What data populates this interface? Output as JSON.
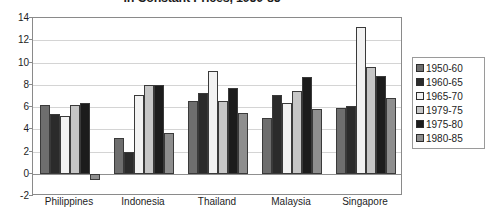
{
  "chart_data": {
    "type": "bar",
    "title": "in Constant Prices, 1950-85",
    "xlabel": "",
    "ylabel": "",
    "ylim": [
      -2,
      14
    ],
    "ytick_step": 2,
    "yticks": [
      14,
      12,
      10,
      8,
      6,
      4,
      2,
      0,
      -2
    ],
    "grid": true,
    "legend_position": "right",
    "categories": [
      "Philippines",
      "Indonesia",
      "Thailand",
      "Malaysia",
      "Singapore"
    ],
    "series": [
      {
        "name": "1950-60",
        "color": "#6e6e6e",
        "values": [
          6.2,
          3.2,
          6.5,
          5.0,
          5.9
        ]
      },
      {
        "name": "1960-65",
        "color": "#2b2b2b",
        "values": [
          5.4,
          2.0,
          7.3,
          7.1,
          6.1
        ]
      },
      {
        "name": "1965-70",
        "color": "#f2f2f2",
        "values": [
          5.2,
          7.1,
          9.2,
          6.4,
          13.2
        ]
      },
      {
        "name": "1979-75",
        "color": "#c6c6c6",
        "values": [
          6.2,
          8.0,
          6.5,
          7.4,
          9.6
        ]
      },
      {
        "name": "1975-80",
        "color": "#1c1c1c",
        "values": [
          6.4,
          8.0,
          7.7,
          8.7,
          8.8
        ]
      },
      {
        "name": "1980-85",
        "color": "#8e8e8e",
        "values": [
          -0.6,
          3.7,
          5.5,
          5.8,
          6.8
        ]
      }
    ]
  }
}
